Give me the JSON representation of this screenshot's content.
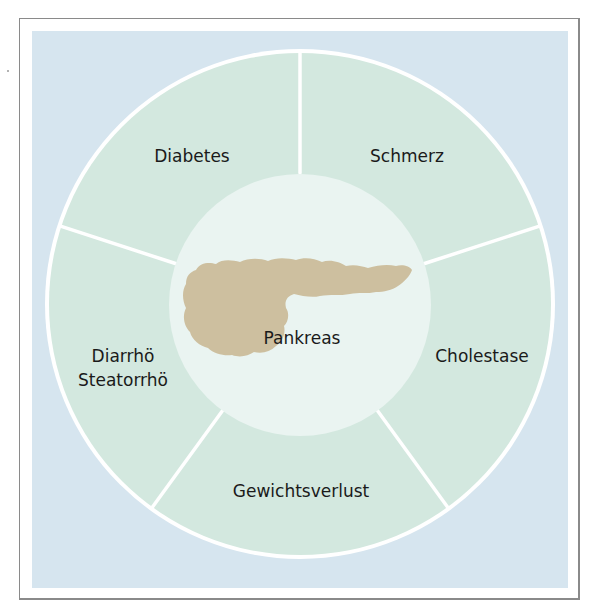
{
  "diagram": {
    "center_label": "Pankreas",
    "segments": [
      {
        "id": "diabetes",
        "lines": [
          "Diabetes"
        ]
      },
      {
        "id": "schmerz",
        "lines": [
          "Schmerz"
        ]
      },
      {
        "id": "cholestase",
        "lines": [
          "Cholestase"
        ]
      },
      {
        "id": "gewichtsverlust",
        "lines": [
          "Gewichtsverlust"
        ]
      },
      {
        "id": "diarrhoe",
        "lines": [
          "Diarrhö",
          "Steatorrhö"
        ]
      }
    ],
    "colors": {
      "background": "#d6e5ef",
      "ring": "#d3e8df",
      "inner_circle": "#eaf4f1",
      "divider": "#ffffff",
      "organ": "#cdbf9f",
      "text": "#1a1a1a",
      "frame_border": "#8a8a8a"
    }
  }
}
